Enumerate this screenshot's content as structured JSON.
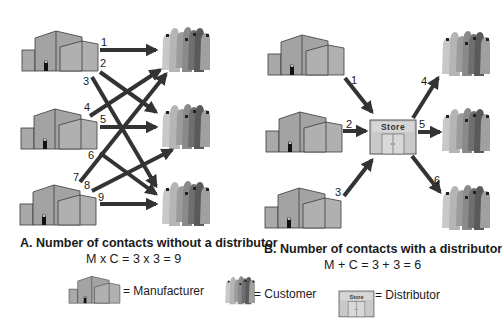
{
  "panel_a": {
    "title": "A. Number of contacts without a distributor",
    "equation": "M x C = 3 x 3 = 9",
    "manufacturers": 3,
    "customers": 3,
    "contact_labels": [
      "1",
      "2",
      "3",
      "4",
      "5",
      "6",
      "7",
      "8",
      "9"
    ]
  },
  "panel_b": {
    "title": "B. Number of contacts with a distributor",
    "equation": "M + C = 3 + 3 = 6",
    "store_label": "Store",
    "contact_labels": [
      "1",
      "2",
      "3",
      "4",
      "5",
      "6"
    ]
  },
  "legend": {
    "manufacturer": "= Manufacturer",
    "customer": "= Customer",
    "distributor": "= Distributor",
    "distributor_icon_label": "Store"
  },
  "colors": {
    "building_fill": "#a9a9a9",
    "building_stroke": "#3a3a3a",
    "arrow": "#333333",
    "store_fill": "#c9c9c9"
  }
}
